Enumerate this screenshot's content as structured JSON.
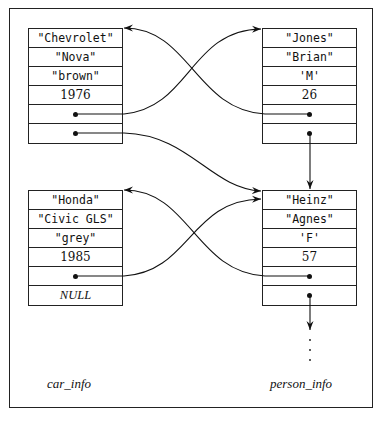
{
  "diagram": {
    "type": "linked-records",
    "car_label": "car_info",
    "person_label": "person_info",
    "cars": [
      {
        "make": "\"Chevrolet\"",
        "model": "\"Nova\"",
        "color": "\"brown\"",
        "year": "1976",
        "owner": "pointer",
        "next": "pointer"
      },
      {
        "make": "\"Honda\"",
        "model": "\"Civic GLS\"",
        "color": "\"grey\"",
        "year": "1985",
        "owner": "pointer",
        "next": "NULL"
      }
    ],
    "persons": [
      {
        "last": "\"Jones\"",
        "first": "\"Brian\"",
        "sex": "'M'",
        "age": "26",
        "car": "pointer",
        "next": "pointer"
      },
      {
        "last": "\"Heinz\"",
        "first": "\"Agnes\"",
        "sex": "'F'",
        "age": "57",
        "car": "pointer",
        "next": "pointer"
      }
    ],
    "null_text": "NULL",
    "continuation": "⋮"
  }
}
